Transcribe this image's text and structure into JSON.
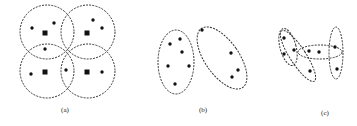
{
  "panels": [
    {
      "label": "(a)",
      "label_pos": [
        65,
        112
      ],
      "circles": [
        {
          "cx": 47,
          "cy": 32,
          "r": 27
        },
        {
          "cx": 88,
          "cy": 32,
          "r": 27
        },
        {
          "cx": 47,
          "cy": 71,
          "r": 27
        },
        {
          "cx": 88,
          "cy": 71,
          "r": 27
        }
      ],
      "squares": [
        [
          45,
          33
        ],
        [
          87,
          33
        ],
        [
          45,
          72
        ],
        [
          87,
          72
        ]
      ],
      "dots": [
        [
          32,
          28
        ],
        [
          54,
          23
        ],
        [
          93,
          20
        ],
        [
          102,
          28
        ],
        [
          45,
          49
        ],
        [
          31,
          74
        ],
        [
          66,
          70
        ],
        [
          102,
          72
        ]
      ]
    },
    {
      "label": "(b)",
      "label_pos": [
        203,
        112
      ],
      "ellipses": [
        {
          "cx": 176,
          "cy": 62,
          "rx": 18,
          "ry": 32,
          "rot": 0
        },
        {
          "cx": 222,
          "cy": 58,
          "rx": 17,
          "ry": 36,
          "rot": -35
        }
      ],
      "dots": [
        [
          170,
          44
        ],
        [
          180,
          39
        ],
        [
          182,
          52
        ],
        [
          168,
          66
        ],
        [
          189,
          66
        ],
        [
          175,
          84
        ],
        [
          202,
          30
        ],
        [
          231,
          53
        ],
        [
          238,
          70
        ],
        [
          232,
          77
        ]
      ]
    },
    {
      "label": "(c)",
      "label_pos": [
        325,
        115
      ],
      "ellipses": [
        {
          "cx": 288,
          "cy": 47,
          "rx": 8,
          "ry": 19,
          "rot": -15
        },
        {
          "cx": 298,
          "cy": 56,
          "rx": 8,
          "ry": 30,
          "rot": -33
        },
        {
          "cx": 320,
          "cy": 52,
          "rx": 22,
          "ry": 7,
          "rot": 0
        },
        {
          "cx": 336,
          "cy": 53,
          "rx": 7,
          "ry": 26,
          "rot": 0
        }
      ],
      "dots": [
        [
          284,
          38
        ],
        [
          284,
          54
        ],
        [
          294,
          50
        ],
        [
          309,
          51
        ],
        [
          319,
          52
        ],
        [
          335,
          47
        ],
        [
          337,
          69
        ],
        [
          310,
          71
        ]
      ]
    }
  ]
}
